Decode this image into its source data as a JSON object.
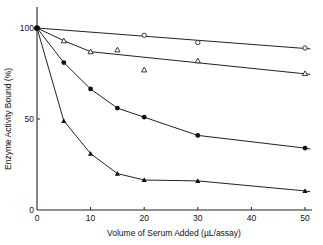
{
  "chart_data": {
    "type": "line",
    "title": "",
    "xlabel": "Volume of  Serum Added (µL/assay)",
    "ylabel": "Enzyme Activity Bound (%)",
    "xlim": [
      0,
      50
    ],
    "ylim": [
      0,
      100
    ],
    "x_ticks": [
      0,
      10,
      20,
      30,
      40,
      50
    ],
    "y_ticks": [
      0,
      50,
      100
    ],
    "grid": false,
    "legend": null,
    "series": [
      {
        "name": "open circles",
        "marker": "open-circle",
        "x": [
          0,
          20,
          30,
          50
        ],
        "values": [
          100,
          96,
          92,
          89
        ],
        "fit_line": [
          [
            0,
            100
          ],
          [
            51,
            88.5
          ]
        ]
      },
      {
        "name": "open triangles",
        "marker": "open-triangle",
        "x": [
          0,
          5,
          10,
          15,
          20,
          30,
          50
        ],
        "values": [
          100,
          93,
          87,
          88,
          77,
          82,
          75
        ],
        "fit_line": [
          [
            0,
            100
          ],
          [
            5,
            93
          ],
          [
            10,
            87
          ],
          [
            51,
            74.5
          ]
        ]
      },
      {
        "name": "filled circles",
        "marker": "filled-circle",
        "x": [
          0,
          5,
          10,
          15,
          20,
          30,
          50
        ],
        "values": [
          100,
          81,
          66.5,
          56,
          51,
          41,
          34
        ],
        "fit_line": [
          [
            0,
            100
          ],
          [
            5,
            81
          ],
          [
            10,
            66.5
          ],
          [
            15,
            56
          ],
          [
            20,
            51
          ],
          [
            30,
            41
          ],
          [
            50,
            34
          ],
          [
            51,
            33.5
          ]
        ]
      },
      {
        "name": "filled triangles",
        "marker": "filled-triangle",
        "x": [
          0,
          5,
          10,
          15,
          20,
          30,
          50
        ],
        "values": [
          100,
          49,
          31,
          20,
          16.5,
          16,
          10.5
        ],
        "fit_line": [
          [
            0,
            100
          ],
          [
            5,
            49
          ],
          [
            10,
            31
          ],
          [
            15,
            20
          ],
          [
            20,
            16.5
          ],
          [
            30,
            16
          ],
          [
            50,
            10.5
          ],
          [
            51,
            10
          ]
        ]
      }
    ]
  },
  "axes": {
    "x_tick_labels": [
      "0",
      "10",
      "20",
      "30",
      "40",
      "50"
    ],
    "y_tick_labels": [
      "0",
      "50",
      "100"
    ]
  }
}
